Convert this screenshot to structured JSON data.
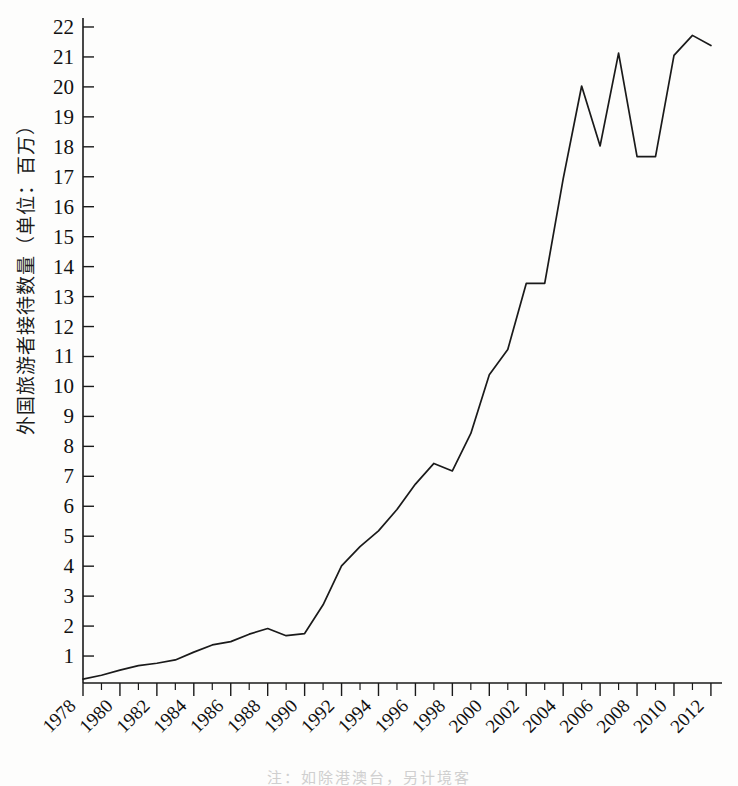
{
  "figure": {
    "ylabel": "外国旅游者接待数量（单位：百万）",
    "caption": "注：如除港澳台，另计境客"
  },
  "chart_data": {
    "type": "line",
    "title": "",
    "xlabel": "",
    "ylabel": "外国旅游者接待数量（单位：百万）",
    "xlim": [
      1978,
      2012.6
    ],
    "ylim": [
      0.1,
      22.3
    ],
    "grid": false,
    "legend": "none",
    "line_color": "#1a1a1a",
    "x_major_ticks": [
      1978,
      1980,
      1982,
      1984,
      1986,
      1988,
      1990,
      1992,
      1994,
      1996,
      1998,
      2000,
      2002,
      2004,
      2006,
      2008,
      2010,
      2012
    ],
    "x_minor_ticks": [
      1979,
      1981,
      1983,
      1985,
      1987,
      1989,
      1991,
      1993,
      1995,
      1997,
      1999,
      2001,
      2003,
      2005,
      2007,
      2009,
      2011
    ],
    "x_tick_labels": [
      "1978",
      "1980",
      "1982",
      "1984",
      "1986",
      "1988",
      "1990",
      "1992",
      "1994",
      "1996",
      "1998",
      "2000",
      "2002",
      "2004",
      "2006",
      "2008",
      "2010",
      "2012"
    ],
    "y_ticks": [
      1,
      2,
      3,
      4,
      5,
      6,
      7,
      8,
      9,
      10,
      11,
      12,
      13,
      14,
      15,
      16,
      17,
      18,
      19,
      20,
      21,
      22
    ],
    "y_tick_labels": [
      "1",
      "2",
      "3",
      "4",
      "5",
      "6",
      "7",
      "8",
      "9",
      "10",
      "11",
      "12",
      "13",
      "14",
      "15",
      "16",
      "17",
      "18",
      "19",
      "20",
      "21",
      "22"
    ],
    "x": [
      1978,
      1979,
      1980,
      1981,
      1982,
      1983,
      1984,
      1985,
      1986,
      1987,
      1988,
      1989,
      1990,
      1991,
      1992,
      1993,
      1994,
      1995,
      1996,
      1997,
      1998,
      1999,
      2000,
      2001,
      2002,
      2003,
      2004,
      2005,
      2006,
      2007,
      2008,
      2009,
      2010,
      2011,
      2012
    ],
    "values": [
      0.23,
      0.36,
      0.53,
      0.68,
      0.76,
      0.87,
      1.13,
      1.37,
      1.48,
      1.73,
      1.92,
      1.68,
      1.75,
      2.71,
      4.01,
      4.65,
      5.18,
      5.89,
      6.74,
      7.43,
      7.18,
      8.43,
      10.39,
      11.23,
      13.44,
      13.44,
      16.93,
      20.03,
      18.03,
      21.13,
      17.67,
      17.67,
      21.05,
      21.72,
      21.38
    ],
    "series": [
      {
        "name": "外国旅游者接待数量",
        "points": [
          {
            "year": 1978,
            "value": 0.23
          },
          {
            "year": 1979,
            "value": 0.36
          },
          {
            "year": 1980,
            "value": 0.53
          },
          {
            "year": 1981,
            "value": 0.68
          },
          {
            "year": 1982,
            "value": 0.76
          },
          {
            "year": 1983,
            "value": 0.87
          },
          {
            "year": 1984,
            "value": 1.13
          },
          {
            "year": 1985,
            "value": 1.37
          },
          {
            "year": 1986,
            "value": 1.48
          },
          {
            "year": 1987,
            "value": 1.73
          },
          {
            "year": 1988,
            "value": 1.92
          },
          {
            "year": 1989,
            "value": 1.68
          },
          {
            "year": 1990,
            "value": 1.75
          },
          {
            "year": 1991,
            "value": 2.71
          },
          {
            "year": 1992,
            "value": 4.01
          },
          {
            "year": 1993,
            "value": 4.65
          },
          {
            "year": 1994,
            "value": 5.18
          },
          {
            "year": 1995,
            "value": 5.89
          },
          {
            "year": 1996,
            "value": 6.74
          },
          {
            "year": 1997,
            "value": 7.43
          },
          {
            "year": 1998,
            "value": 7.18
          },
          {
            "year": 1999,
            "value": 8.43
          },
          {
            "year": 2000,
            "value": 10.39
          },
          {
            "year": 2001,
            "value": 11.23
          },
          {
            "year": 2002,
            "value": 13.44
          },
          {
            "year": 2003,
            "value": 13.44
          },
          {
            "year": 2004,
            "value": 16.93
          },
          {
            "year": 2005,
            "value": 20.03
          },
          {
            "year": 2006,
            "value": 18.03
          },
          {
            "year": 2007,
            "value": 21.13
          },
          {
            "year": 2008,
            "value": 17.67
          },
          {
            "year": 2009,
            "value": 17.67
          },
          {
            "year": 2010,
            "value": 21.05
          },
          {
            "year": 2011,
            "value": 21.72
          },
          {
            "year": 2012,
            "value": 21.38
          }
        ]
      }
    ]
  }
}
